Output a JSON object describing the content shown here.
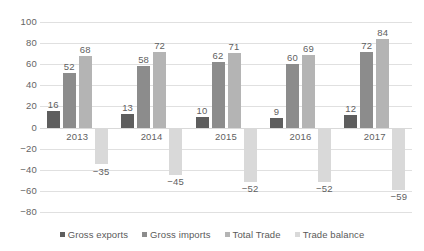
{
  "chart_data": {
    "type": "bar",
    "title": "",
    "subtitle": "",
    "xlabel": "",
    "ylabel": "",
    "ylim": [
      -80,
      100
    ],
    "ytick_step": 20,
    "yticks": [
      "100",
      "80",
      "60",
      "40",
      "20",
      "0",
      "−20",
      "−40",
      "−60",
      "−80"
    ],
    "ytick_values": [
      100,
      80,
      60,
      40,
      20,
      0,
      -20,
      -40,
      -60,
      -80
    ],
    "grid": true,
    "legend_position": "bottom",
    "categories": [
      "2013",
      "2014",
      "2015",
      "2016",
      "2017"
    ],
    "series": [
      {
        "name": "Gross exports",
        "color": "#5e5e5e",
        "values": [
          16,
          13,
          10,
          9,
          12
        ],
        "labels": [
          "16",
          "13",
          "10",
          "9",
          "12"
        ]
      },
      {
        "name": "Gross imports",
        "color": "#8c8c8c",
        "values": [
          52,
          58,
          62,
          60,
          72
        ],
        "labels": [
          "52",
          "58",
          "62",
          "60",
          "72"
        ]
      },
      {
        "name": "Total Trade",
        "color": "#b4b4b4",
        "values": [
          68,
          72,
          71,
          69,
          84
        ],
        "labels": [
          "68",
          "72",
          "71",
          "69",
          "84"
        ]
      },
      {
        "name": "Trade balance",
        "color": "#d9d9d9",
        "values": [
          -35,
          -45,
          -52,
          -52,
          -59
        ],
        "labels": [
          "−35",
          "−45",
          "−52",
          "−52",
          "−59"
        ]
      }
    ]
  },
  "legend": {
    "items": [
      {
        "label": "Gross exports",
        "color": "#5e5e5e"
      },
      {
        "label": "Gross imports",
        "color": "#8c8c8c"
      },
      {
        "label": "Total Trade",
        "color": "#b4b4b4"
      },
      {
        "label": "Trade balance",
        "color": "#d9d9d9"
      }
    ]
  },
  "colors": {
    "gridline": "#e0e0e0",
    "zero_line": "#d9d9d9",
    "text": "#5f5f5f",
    "background": "#ffffff"
  }
}
